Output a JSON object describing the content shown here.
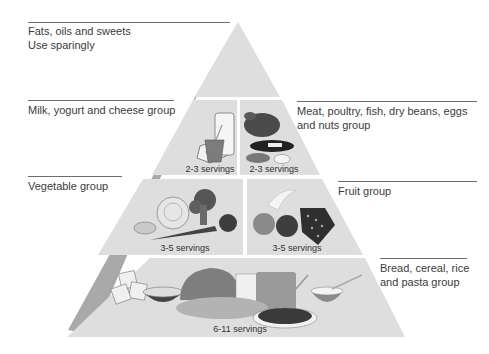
{
  "colors": {
    "face": "#dedede",
    "side": "#a9a9a9",
    "gap": "#ffffff",
    "rule": "#6e6e6e",
    "text": "#3b3b3b"
  },
  "tiers": [
    {
      "id": "fats",
      "label_lines": [
        "Fats, oils and sweets",
        "Use sparingly"
      ],
      "side": "left",
      "servings": null
    },
    {
      "id": "milk",
      "label_lines": [
        "Milk, yogurt and cheese group"
      ],
      "side": "left",
      "servings": "2-3 servings",
      "icons": [
        "cheese-icon",
        "milk-glass-icon",
        "yogurt-cup-icon"
      ]
    },
    {
      "id": "meat",
      "label_lines": [
        "Meat, poultry, fish, dry beans, eggs",
        "and nuts group"
      ],
      "side": "right",
      "servings": "2-3 servings",
      "icons": [
        "chicken-icon",
        "fish-icon",
        "beans-icon",
        "egg-icon"
      ]
    },
    {
      "id": "vegetable",
      "label_lines": [
        "Vegetable group"
      ],
      "side": "left",
      "servings": "3-5 servings",
      "icons": [
        "potato-icon",
        "cabbage-icon",
        "broccoli-icon",
        "carrot-icon",
        "tomato-icon"
      ]
    },
    {
      "id": "fruit",
      "label_lines": [
        "Fruit group"
      ],
      "side": "right",
      "servings": "3-5 servings",
      "icons": [
        "orange-icon",
        "apple-icon",
        "grapes-icon",
        "banana-icon"
      ]
    },
    {
      "id": "bread",
      "label_lines": [
        "Bread, cereal, rice",
        "and pasta group"
      ],
      "side": "right",
      "servings": "6-11 servings",
      "icons": [
        "crackers-icon",
        "cereal-bowl-icon",
        "bread-loaf-icon",
        "pasta-plate-icon",
        "rice-bowl-icon"
      ]
    }
  ]
}
